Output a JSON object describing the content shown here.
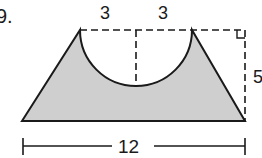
{
  "problem": {
    "number": "9.",
    "labels": {
      "top_left_width": "3",
      "top_right_width": "3",
      "height": "5",
      "base": "12"
    }
  },
  "colors": {
    "fill": "#cfcfcf",
    "stroke": "#1a1a1a",
    "background": "#ffffff"
  }
}
